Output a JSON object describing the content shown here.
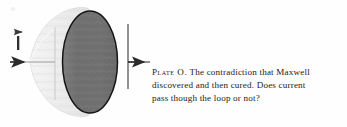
{
  "figure": {
    "labels": {
      "current_symbol": "I"
    },
    "colors": {
      "cone_fill": "#ebebeb",
      "cone_edge": "#d8d8d8",
      "disk_fill": "#6f6f6f",
      "disk_stroke": "#161616",
      "plate_line": "#6f6f6f",
      "wire": "#2b2b2b",
      "paper": "#ffffff",
      "ink": "#1d1a18"
    },
    "elements": [
      {
        "name": "current-arrow-left",
        "kind": "arrow",
        "direction": "right"
      },
      {
        "name": "current-label-I",
        "kind": "text",
        "value": "I"
      },
      {
        "name": "current-label-arrow",
        "kind": "arrow",
        "direction": "right"
      },
      {
        "name": "capacitor-plate-left",
        "kind": "line",
        "orientation": "vertical"
      },
      {
        "name": "capacitor-plate-right",
        "kind": "line",
        "orientation": "vertical"
      },
      {
        "name": "balloon-surface",
        "kind": "cone"
      },
      {
        "name": "loop-disk",
        "kind": "ellipse"
      },
      {
        "name": "current-arrow-right",
        "kind": "arrow",
        "direction": "right"
      }
    ]
  },
  "caption": {
    "lead": "Plate O.",
    "line1_rest": "The contradiction that Maxwell",
    "line2": "discovered and then cured. Does current",
    "line3": "pass though the loop or not?",
    "full_text": "Plate O. The contradiction that Maxwell discovered and then cured. Does current pass though the loop or not?"
  }
}
